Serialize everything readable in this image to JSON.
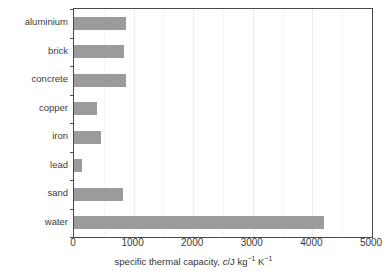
{
  "chart_data": {
    "type": "bar",
    "orientation": "horizontal",
    "title": "",
    "subtitle": "",
    "xlabel": "specific thermal capacity, c/J kg⁻¹ K⁻¹",
    "xlabel_parts": {
      "prefix": "specific thermal capacity, ",
      "symbol": "c",
      "unit_lead": "/J kg",
      "unit_exp1": "−1",
      "unit_mid": " K",
      "unit_exp2": "−1"
    },
    "ylabel": "",
    "categories": [
      "aluminium",
      "brick",
      "concrete",
      "copper",
      "iron",
      "lead",
      "sand",
      "water"
    ],
    "values": [
      880,
      840,
      880,
      385,
      450,
      130,
      820,
      4200
    ],
    "xlim": [
      0,
      5000
    ],
    "xticks": [
      0,
      1000,
      2000,
      3000,
      4000,
      5000
    ],
    "xtick_labels": [
      "0",
      "1000",
      "2000",
      "3000",
      "4000",
      "5000"
    ],
    "xminor_ticks": [
      500,
      1500,
      2500,
      3500,
      4500
    ],
    "grid": "vertical",
    "legend": "none",
    "bar_color": "#9b9b9b",
    "axis_color": "#4a4a4a",
    "grid_color": "#ededed",
    "text_color": "#3b3b3b",
    "background": "#ffffff"
  }
}
